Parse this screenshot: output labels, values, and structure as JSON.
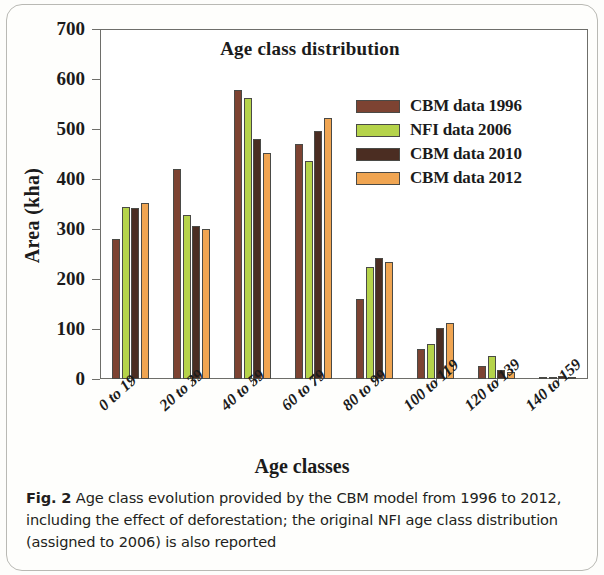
{
  "figure": {
    "caption_label": "Fig. 2",
    "caption_text": "Age class evolution provided by the CBM model from 1996 to 2012, including the effect of deforestation; the original NFI age class distribution (assigned to 2006) is also reported"
  },
  "chart_data": {
    "type": "bar",
    "title": "Age class distribution",
    "xlabel": "Age classes",
    "ylabel": "Area (kha)",
    "ylim": [
      0,
      700
    ],
    "yticks": [
      0,
      100,
      200,
      300,
      400,
      500,
      600,
      700
    ],
    "grid": false,
    "legend_position": "top-right inside plot",
    "categories": [
      "0 to 19",
      "20 to 39",
      "40 to 59",
      "60 to 79",
      "80 to 99",
      "100 to 119",
      "120 to 139",
      "140 to 159"
    ],
    "series": [
      {
        "name": "CBM data 1996",
        "color": "#7d4332",
        "values": [
          281,
          420,
          578,
          470,
          160,
          60,
          27,
          2
        ]
      },
      {
        "name": "NFI data 2006",
        "color": "#b5d34a",
        "values": [
          344,
          328,
          563,
          437,
          225,
          70,
          47,
          5
        ]
      },
      {
        "name": "CBM data 2010",
        "color": "#4b2d22",
        "values": [
          342,
          307,
          481,
          497,
          242,
          102,
          19,
          7
        ]
      },
      {
        "name": "CBM data 2012",
        "color": "#f0a552",
        "values": [
          352,
          300,
          452,
          522,
          235,
          112,
          14,
          5
        ]
      }
    ]
  }
}
